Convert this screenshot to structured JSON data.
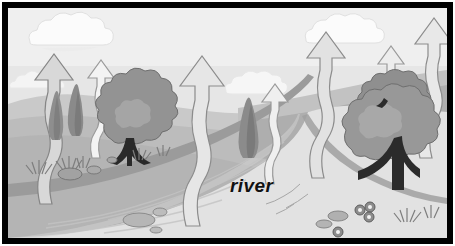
{
  "illustration": {
    "title": "river evaporation landscape",
    "label": "river",
    "caption_position": "center-bottom-of-river",
    "style": "grayscale cartoon line illustration",
    "border_color": "#000000",
    "border_width_px": 6
  },
  "palette": {
    "sky": "#efefef",
    "sky_low": "#e4e4e4",
    "cloud": "#fbfbfb",
    "cloud_shade": "#e6e6e6",
    "hill_far": "#c9c9c9",
    "hill_mid": "#bcbcbc",
    "hill_near": "#b0b0b0",
    "bank": "#a8a8a8",
    "water": "#e2e2e2",
    "water_shade": "#d2d2d2",
    "tree_light": "#a6a6a6",
    "tree_mid": "#939393",
    "tree_dark": "#7d7d7d",
    "trunk": "#2a2a2a",
    "arrow_fill": "#dcdcdc",
    "arrow_fill_light": "#f2f2f2",
    "outline": "#6e6e6e",
    "label_text": "#111111"
  },
  "elements": {
    "arrows": [
      {
        "name": "arrow-1",
        "x": 38,
        "size": "large",
        "fill": "#d6d6d6"
      },
      {
        "name": "arrow-2",
        "x": 95,
        "size": "small",
        "fill": "#f2f2f2"
      },
      {
        "name": "arrow-3",
        "x": 188,
        "size": "large",
        "fill": "#e4e4e4"
      },
      {
        "name": "arrow-4",
        "x": 269,
        "size": "small",
        "fill": "#eeeeee"
      },
      {
        "name": "arrow-5",
        "x": 320,
        "size": "large",
        "fill": "#e0e0e0"
      },
      {
        "name": "arrow-6",
        "x": 390,
        "size": "small",
        "fill": "#ececec"
      },
      {
        "name": "arrow-7",
        "x": 430,
        "size": "large",
        "fill": "#e6e6e6"
      }
    ],
    "clouds": [
      {
        "name": "cloud-left",
        "x": 62,
        "y": 30
      },
      {
        "name": "cloud-center",
        "x": 243,
        "y": 76
      },
      {
        "name": "cloud-right",
        "x": 340,
        "y": 27
      }
    ],
    "trees": [
      {
        "name": "cypress-left",
        "x": 48,
        "type": "cypress"
      },
      {
        "name": "cypress-mid",
        "x": 68,
        "type": "cypress"
      },
      {
        "name": "broadleaf-left",
        "x": 126,
        "type": "broadleaf"
      },
      {
        "name": "cypress-center",
        "x": 243,
        "type": "cypress"
      },
      {
        "name": "broadleaf-right",
        "x": 404,
        "type": "broadleaf-large"
      }
    ],
    "ground_details": [
      {
        "name": "grass-tuft",
        "count": 6
      },
      {
        "name": "rock",
        "count": 5
      },
      {
        "name": "flower-cluster",
        "count": 2
      }
    ]
  }
}
